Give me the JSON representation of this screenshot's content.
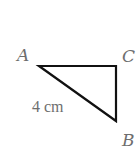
{
  "diagram": {
    "type": "right-triangle",
    "vertices": {
      "A": {
        "label": "A",
        "x": 39,
        "y": 66
      },
      "C": {
        "label": "C",
        "x": 116,
        "y": 66
      },
      "B": {
        "label": "B",
        "x": 116,
        "y": 121
      }
    },
    "edges": [
      {
        "from": "A",
        "to": "C"
      },
      {
        "from": "C",
        "to": "B"
      },
      {
        "from": "A",
        "to": "B",
        "label": "4 cm"
      }
    ],
    "measurement_label": "4 cm",
    "stroke_color": "#111111",
    "label_color": "#6e6e6e"
  }
}
